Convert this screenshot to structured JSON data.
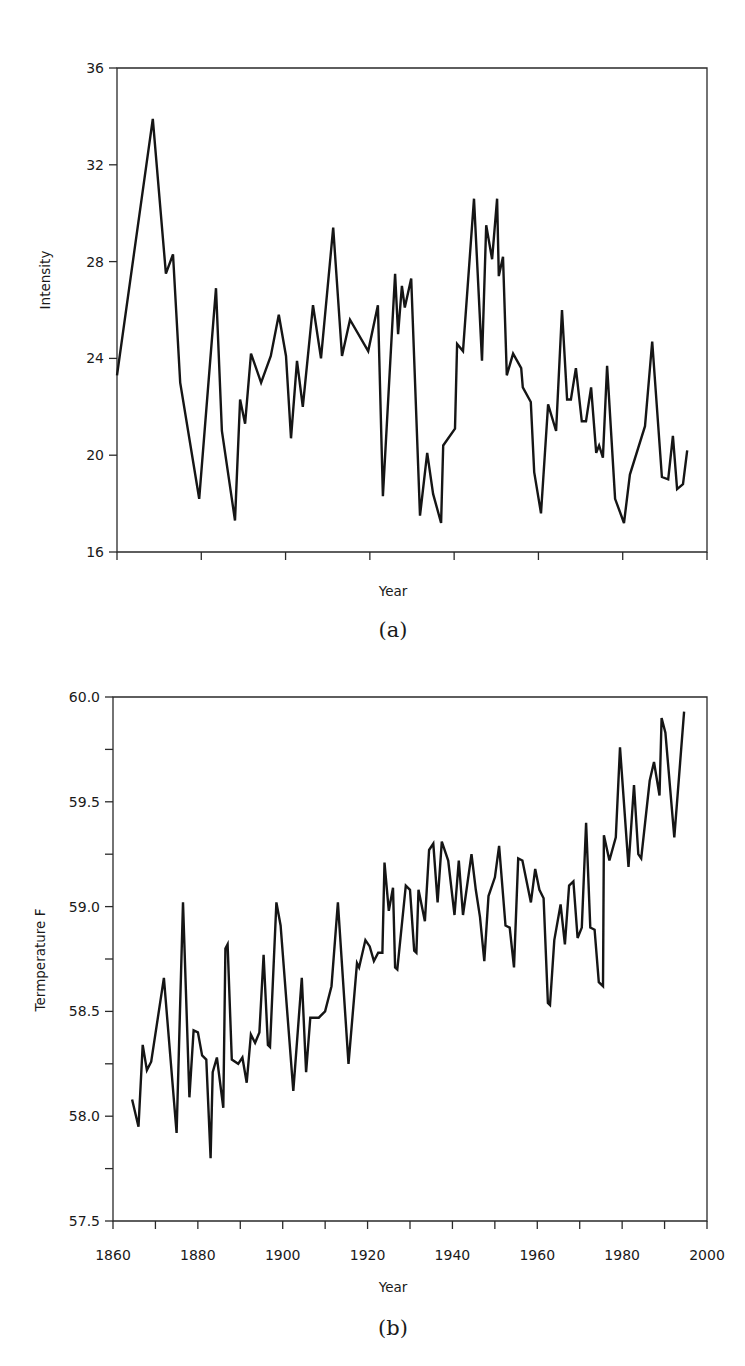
{
  "chart_data": [
    {
      "type": "line",
      "panel_label": "(a)",
      "title": "",
      "xlabel": "Year",
      "ylabel": "Intensity",
      "xlim": [
        1860,
        2000
      ],
      "ylim": [
        16,
        36
      ],
      "yticks": [
        16,
        20,
        24,
        28,
        32,
        36
      ],
      "ytick_labels": [
        "16",
        "20",
        "24",
        "28",
        "32",
        "36"
      ],
      "xticks": [
        1860,
        1880,
        1900,
        1920,
        1940,
        1960,
        1980,
        2000
      ],
      "xtick_labels": [],
      "grid": false,
      "legend": null,
      "series": [
        {
          "name": "Intensity",
          "x": [
            1860.0,
            1868.5,
            1871.6,
            1873.3,
            1875.0,
            1879.5,
            1883.5,
            1884.9,
            1888.0,
            1889.2,
            1890.4,
            1891.8,
            1894.2,
            1896.5,
            1898.4,
            1900.1,
            1901.3,
            1902.7,
            1904.1,
            1906.5,
            1908.4,
            1911.3,
            1913.4,
            1915.3,
            1919.6,
            1921.9,
            1923.1,
            1926.0,
            1926.7,
            1927.6,
            1928.3,
            1929.8,
            1931.9,
            1933.6,
            1935.0,
            1936.9,
            1937.4,
            1940.2,
            1940.7,
            1942.1,
            1944.7,
            1946.6,
            1947.6,
            1949.0,
            1950.2,
            1950.6,
            1951.6,
            1952.5,
            1954.0,
            1955.9,
            1956.3,
            1958.2,
            1959.0,
            1960.6,
            1962.3,
            1964.2,
            1965.6,
            1966.8,
            1967.7,
            1968.9,
            1970.3,
            1971.3,
            1972.5,
            1973.7,
            1974.4,
            1975.3,
            1976.3,
            1978.2,
            1980.3,
            1981.7,
            1985.3,
            1987.0,
            1989.3,
            1990.8,
            1991.9,
            1992.9,
            1994.3,
            1995.3
          ],
          "values": [
            23.3,
            33.9,
            27.5,
            28.3,
            23.0,
            18.2,
            26.9,
            21.0,
            17.3,
            22.3,
            21.3,
            24.2,
            23.0,
            24.1,
            25.8,
            24.1,
            20.7,
            23.9,
            22.0,
            26.2,
            24.0,
            29.4,
            24.1,
            25.6,
            24.3,
            26.2,
            18.3,
            27.5,
            25.0,
            27.0,
            26.1,
            27.3,
            17.5,
            20.1,
            18.4,
            17.2,
            20.4,
            21.1,
            24.6,
            24.3,
            30.6,
            23.9,
            29.5,
            28.1,
            30.6,
            27.4,
            28.2,
            23.3,
            24.2,
            23.6,
            22.8,
            22.2,
            19.3,
            17.6,
            22.1,
            21.0,
            26.0,
            22.3,
            22.3,
            23.6,
            21.4,
            21.4,
            22.8,
            20.1,
            20.4,
            19.9,
            23.7,
            18.2,
            17.2,
            19.2,
            21.2,
            24.7,
            19.1,
            19.0,
            20.8,
            18.6,
            18.8,
            20.2
          ]
        }
      ]
    },
    {
      "type": "line",
      "panel_label": "(b)",
      "title": "",
      "xlabel": "Year",
      "ylabel": "Termperature F",
      "xlim": [
        1860,
        2000
      ],
      "ylim": [
        57.5,
        60.0
      ],
      "yticks": [
        57.5,
        58.0,
        58.5,
        59.0,
        59.5,
        60.0
      ],
      "ytick_labels": [
        "57.5",
        "58.0",
        "58.5",
        "59.0",
        "59.5",
        "60.0"
      ],
      "yminor_ticks": [
        57.75,
        58.25,
        58.75,
        59.25,
        59.75
      ],
      "xticks": [
        1860,
        1880,
        1900,
        1920,
        1940,
        1960,
        1980,
        2000
      ],
      "xtick_labels": [
        "1860",
        "1880",
        "1900",
        "1920",
        "1940",
        "1960",
        "1980",
        "2000"
      ],
      "xminor_ticks": [
        1870,
        1890,
        1910,
        1930,
        1950,
        1970,
        1990
      ],
      "grid": false,
      "legend": null,
      "series": [
        {
          "name": "Temperature",
          "x": [
            1864.5,
            1866,
            1867,
            1868,
            1869,
            1872,
            1875,
            1876.5,
            1878,
            1879,
            1880,
            1881,
            1882,
            1883,
            1883.5,
            1884.5,
            1886,
            1886.5,
            1887,
            1888,
            1889.5,
            1890.5,
            1891.5,
            1892.5,
            1893.5,
            1894.5,
            1895.5,
            1896.5,
            1897,
            1898.5,
            1899.5,
            1902.5,
            1904.5,
            1905.5,
            1906.5,
            1908.5,
            1910,
            1911.5,
            1913,
            1915.5,
            1917.5,
            1918,
            1919.5,
            1920.5,
            1921.5,
            1922.5,
            1923.5,
            1924,
            1925,
            1926,
            1926.5,
            1927,
            1929,
            1930,
            1931,
            1931.5,
            1932,
            1933.5,
            1934.5,
            1935.5,
            1936.5,
            1937.5,
            1939,
            1940.5,
            1941.5,
            1942.5,
            1944.5,
            1945.5,
            1946.5,
            1947.5,
            1948.5,
            1950,
            1951,
            1952.5,
            1953.5,
            1954.5,
            1955.5,
            1956.5,
            1958.5,
            1959.5,
            1960.5,
            1961.5,
            1962.5,
            1963,
            1964,
            1965.5,
            1966.5,
            1967.5,
            1968.5,
            1969.5,
            1970.5,
            1971.5,
            1972.5,
            1973.5,
            1974.5,
            1975.5,
            1975.7,
            1977,
            1978.5,
            1979.5,
            1981.5,
            1982.8,
            1983.8,
            1984.5,
            1986.5,
            1987.5,
            1988.8,
            1989.3,
            1990.2,
            1992.3,
            1994.6
          ],
          "values": [
            58.08,
            57.95,
            58.34,
            58.22,
            58.26,
            58.66,
            57.92,
            59.02,
            58.09,
            58.41,
            58.4,
            58.29,
            58.27,
            57.8,
            58.21,
            58.28,
            58.04,
            58.8,
            58.82,
            58.27,
            58.25,
            58.28,
            58.16,
            58.39,
            58.35,
            58.4,
            58.77,
            58.34,
            58.33,
            59.02,
            58.91,
            58.12,
            58.66,
            58.21,
            58.47,
            58.47,
            58.5,
            58.62,
            59.02,
            58.25,
            58.73,
            58.71,
            58.84,
            58.81,
            58.74,
            58.78,
            58.78,
            59.21,
            58.98,
            59.09,
            58.71,
            58.7,
            59.1,
            59.08,
            58.79,
            58.78,
            59.08,
            58.93,
            59.27,
            59.3,
            59.02,
            59.31,
            59.22,
            58.96,
            59.22,
            58.96,
            59.25,
            59.08,
            58.95,
            58.74,
            59.05,
            59.14,
            59.29,
            58.91,
            58.9,
            58.71,
            59.23,
            59.22,
            59.02,
            59.18,
            59.08,
            59.04,
            58.54,
            58.53,
            58.84,
            59.01,
            58.82,
            59.1,
            59.12,
            58.85,
            58.9,
            59.4,
            58.9,
            58.89,
            58.64,
            58.62,
            59.34,
            59.22,
            59.33,
            59.76,
            59.19,
            59.58,
            59.25,
            59.23,
            59.6,
            59.69,
            59.53,
            59.9,
            59.83,
            59.33,
            59.93
          ]
        }
      ]
    }
  ],
  "panels": {
    "a": {
      "xlabel": "Year",
      "ylabel": "Intensity",
      "label": "(a)"
    },
    "b": {
      "xlabel": "Year",
      "ylabel": "Termperature F",
      "label": "(b)"
    }
  }
}
